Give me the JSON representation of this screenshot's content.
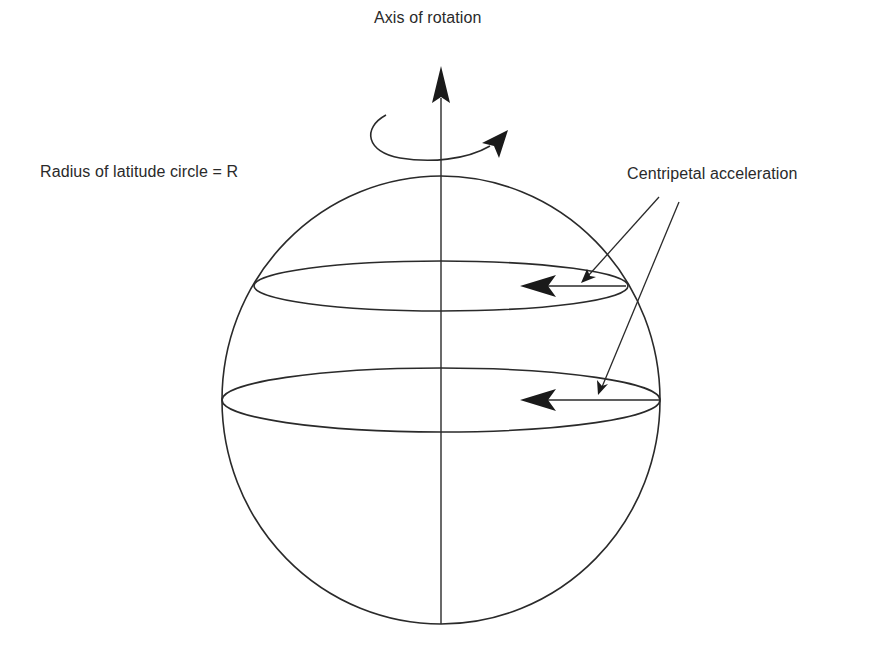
{
  "diagram": {
    "labels": {
      "axis": "Axis of rotation",
      "radius": "Radius of latitude circle = R",
      "centripetal": "Centripetal acceleration"
    },
    "colors": {
      "stroke": "#2a2a2a",
      "background": "#ffffff"
    },
    "elements": {
      "sphere": {
        "cx": 441,
        "cy": 400,
        "rx": 219,
        "ry": 224
      },
      "rotation_axis": {
        "x": 441,
        "y_top": 70,
        "y_bottom": 624
      },
      "latitude_circles": [
        {
          "name": "upper",
          "cx": 441,
          "cy": 286,
          "rx": 187,
          "ry": 25
        },
        {
          "name": "equator",
          "cx": 441,
          "cy": 400,
          "rx": 219,
          "ry": 32
        }
      ],
      "centripetal_arrows": [
        {
          "from_x": 627,
          "to_x": 520,
          "y": 286
        },
        {
          "from_x": 659,
          "to_x": 520,
          "y": 400
        }
      ]
    }
  }
}
